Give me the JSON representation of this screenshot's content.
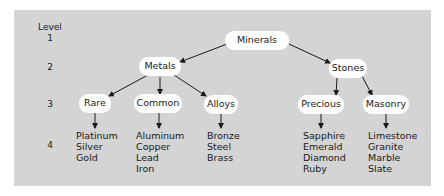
{
  "diagram": {
    "type": "hierarchy-tree",
    "colors": {
      "panel": "#d4d4d4",
      "node": "#ffffff",
      "text": "#1a1a1a",
      "edge": "#1a1a1a"
    },
    "levels": {
      "header": "Level",
      "labels": [
        "1",
        "2",
        "3",
        "4"
      ]
    },
    "root": {
      "label": "Minerals"
    },
    "level2": [
      {
        "label": "Metals"
      },
      {
        "label": "Stones"
      }
    ],
    "level3": [
      {
        "label": "Rare",
        "parent": "Metals"
      },
      {
        "label": "Common",
        "parent": "Metals"
      },
      {
        "label": "Alloys",
        "parent": "Metals"
      },
      {
        "label": "Precious",
        "parent": "Stones"
      },
      {
        "label": "Masonry",
        "parent": "Stones"
      }
    ],
    "level4": [
      {
        "parent": "Rare",
        "items": [
          "Platinum",
          "Silver",
          "Gold"
        ]
      },
      {
        "parent": "Common",
        "items": [
          "Aluminum",
          "Copper",
          "Lead",
          "Iron"
        ]
      },
      {
        "parent": "Alloys",
        "items": [
          "Bronze",
          "Steel",
          "Brass"
        ]
      },
      {
        "parent": "Precious",
        "items": [
          "Sapphire",
          "Emerald",
          "Diamond",
          "Ruby"
        ]
      },
      {
        "parent": "Masonry",
        "items": [
          "Limestone",
          "Granite",
          "Marble",
          "Slate"
        ]
      }
    ]
  }
}
